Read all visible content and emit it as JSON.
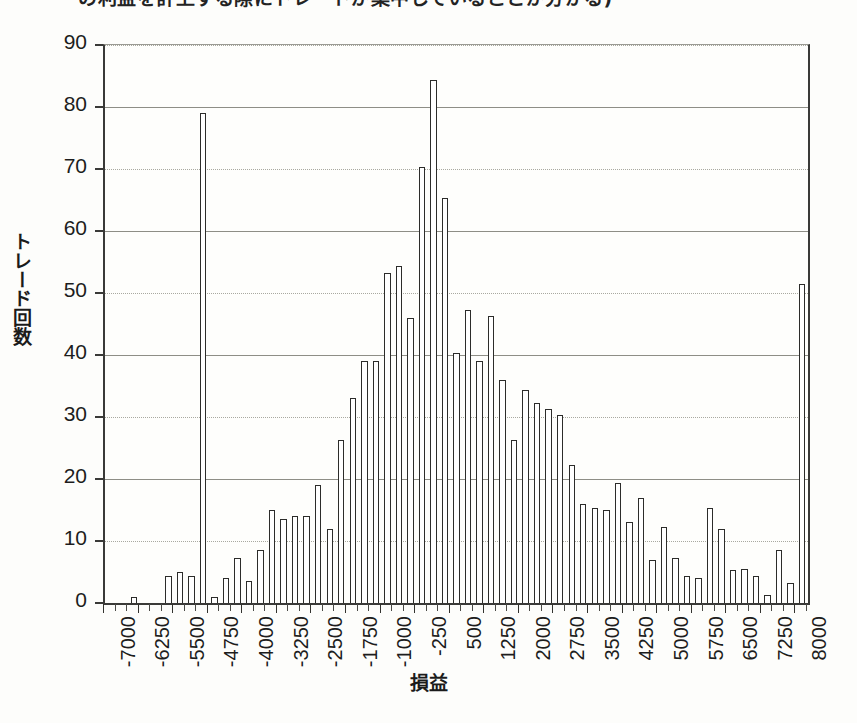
{
  "figure": {
    "top_caption": "の利益を計上する際にトレードが集中していることが分かる)",
    "ylabel": "トレード回数",
    "xlabel": "損益"
  },
  "chart_data": {
    "type": "bar",
    "title": "",
    "subtitle": "",
    "xlabel": "損益",
    "ylabel": "トレード回数",
    "xlim": [
      -7125,
      8125
    ],
    "ylim": [
      0,
      90
    ],
    "ytick_step": 10,
    "bin_width": 250,
    "grid": true,
    "legend": "none",
    "yticks": [
      0,
      10,
      20,
      30,
      40,
      50,
      60,
      70,
      80,
      90
    ],
    "xtick_labels": [
      "-7000",
      "-6250",
      "-5500",
      "-4750",
      "-4000",
      "-3250",
      "-2500",
      "-1750",
      "-1000",
      "-250",
      "500",
      "1250",
      "2000",
      "2750",
      "3500",
      "4250",
      "5000",
      "5750",
      "6500",
      "7250",
      "8000"
    ],
    "xtick_label_step": 750,
    "categories": [
      -7000,
      -6750,
      -6500,
      -6250,
      -6000,
      -5750,
      -5500,
      -5250,
      -5000,
      -4750,
      -4500,
      -4250,
      -4000,
      -3750,
      -3500,
      -3250,
      -3000,
      -2750,
      -2500,
      -2250,
      -2000,
      -1750,
      -1500,
      -1250,
      -1000,
      -750,
      -500,
      -250,
      0,
      250,
      500,
      750,
      1000,
      1250,
      1500,
      1750,
      2000,
      2250,
      2500,
      2750,
      3000,
      3250,
      3500,
      3750,
      4000,
      4250,
      4500,
      4750,
      5000,
      5250,
      5500,
      5750,
      6000,
      6250,
      6500,
      6750,
      7000,
      7250,
      7500,
      7750,
      8000
    ],
    "values": [
      0,
      0,
      1,
      0,
      0,
      4.3,
      5,
      4.3,
      79,
      1,
      4,
      7.3,
      3.5,
      8.5,
      15,
      13.5,
      14,
      14,
      19,
      12,
      26.3,
      33,
      39,
      39,
      53.3,
      54.3,
      46,
      70.3,
      84.3,
      65.3,
      40.3,
      47.3,
      39,
      46.3,
      36,
      26.3,
      34.3,
      32.3,
      31.3,
      30.3,
      22.3,
      16,
      15.3,
      15,
      19.3,
      13,
      17,
      7,
      12.3,
      7.3,
      4.3,
      4,
      15.3,
      12,
      5.3,
      5.5,
      4.3,
      1.3,
      8.5,
      3.3,
      51.5
    ]
  }
}
